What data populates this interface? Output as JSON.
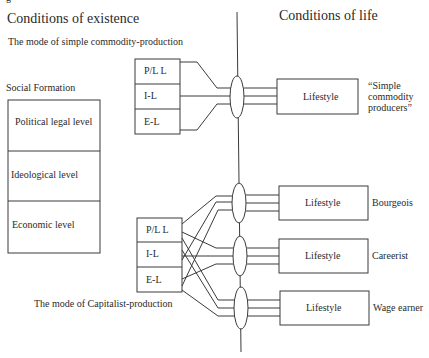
{
  "figure_fragment": "g",
  "headers": {
    "left": "Conditions of existence",
    "right": "Conditions of life"
  },
  "modes": {
    "simple": "The mode of simple commodity-production",
    "capitalist": "The mode of Capitalist-production"
  },
  "social_formation": {
    "title": "Social Formation",
    "levels": [
      "Political legal level",
      "Ideological level",
      "Economic level"
    ]
  },
  "upper_stack": [
    "P/L L",
    "I-L",
    "E-L"
  ],
  "lower_stack": [
    "P/L L",
    "I-L",
    "E-L"
  ],
  "lifestyles": [
    {
      "box": "Lifestyle",
      "label": "“Simple commodity producers”",
      "label_lines": [
        "“Simple",
        "commodity",
        "producers”"
      ]
    },
    {
      "box": "Lifestyle",
      "label": "Bourgeois"
    },
    {
      "box": "Lifestyle",
      "label": "Careerist"
    },
    {
      "box": "Lifestyle",
      "label": "Wage earner"
    }
  ],
  "colors": {
    "line": "#3a3a3a",
    "text": "#2a2a2a",
    "background": "#ffffff"
  }
}
